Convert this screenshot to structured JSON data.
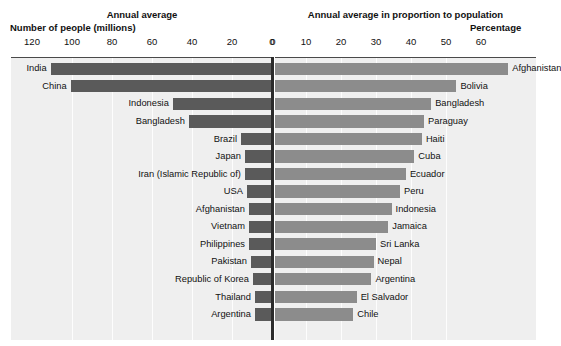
{
  "left": {
    "section_title": "Annual average",
    "axis_label": "Number of people (millions)",
    "ticks": [
      "120",
      "100",
      "80",
      "60",
      "40",
      "20",
      "0"
    ],
    "bar_color": "#5a5a5a"
  },
  "right": {
    "section_title": "Annual average in proportion to population",
    "axis_label": "Percentage",
    "ticks": [
      "0",
      "10",
      "20",
      "30",
      "40",
      "50",
      "60"
    ],
    "bar_color": "#8c8c8c"
  },
  "chart_data": {
    "type": "bar",
    "title": "",
    "orientation": "horizontal-diverging",
    "panels": [
      {
        "name": "Annual average",
        "xlabel": "Number of people (millions)",
        "xlim": [
          0,
          130
        ],
        "ticks": [
          120,
          100,
          80,
          60,
          40,
          20,
          0
        ],
        "direction": "left",
        "categories": [
          "India",
          "China",
          "Indonesia",
          "Bangladesh",
          "Brazil",
          "Japan",
          "Iran (Islamic Republic of)",
          "USA",
          "Afghanistan",
          "Vietnam",
          "Philippines",
          "Pakistan",
          "Republic of Korea",
          "Thailand",
          "Argentina"
        ],
        "values": [
          111,
          101,
          50,
          42,
          16,
          14,
          14,
          13,
          12,
          12,
          12,
          11,
          10,
          9,
          9
        ]
      },
      {
        "name": "Annual average in proportion to population",
        "xlabel": "Percentage",
        "xlim": [
          0,
          62
        ],
        "ticks": [
          0,
          10,
          20,
          30,
          40,
          50,
          60
        ],
        "direction": "right",
        "categories": [
          "Afghanistan",
          "Bolivia",
          "Bangladesh",
          "Paraguay",
          "Haiti",
          "Cuba",
          "Ecuador",
          "Peru",
          "Indonesia",
          "Jamaica",
          "Sri Lanka",
          "Nepal",
          "Argentina",
          "El Salvador",
          "Chile"
        ],
        "values": [
          55.4,
          43.1,
          37.1,
          35.4,
          34.9,
          33.1,
          31.1,
          29.7,
          27.7,
          26.9,
          24.0,
          23.4,
          22.9,
          19.4,
          18.6
        ]
      }
    ],
    "grid": true,
    "legend": "none"
  }
}
